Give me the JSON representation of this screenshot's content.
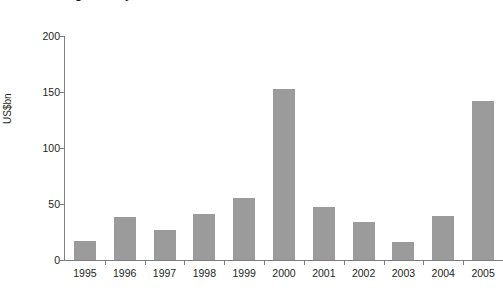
{
  "title": {
    "text": "Banking industry consolidation",
    "note": "clipped-at-top-of-image"
  },
  "axis": {
    "y_title": "US$bn",
    "y_ticks": [
      "0",
      "50",
      "100",
      "150",
      "200"
    ],
    "x_labels": [
      "1995",
      "1996",
      "1997",
      "1998",
      "1999",
      "2000",
      "2001",
      "2002",
      "2003",
      "2004",
      "2005"
    ]
  },
  "colors": {
    "bar": "#9b9b9b",
    "axis": "#7f7f7f",
    "text": "#231f20",
    "background": "#ffffff"
  },
  "chart_data": {
    "type": "bar",
    "title": "Banking industry consolidation",
    "xlabel": "",
    "ylabel": "US$bn",
    "ylim": [
      0,
      200
    ],
    "yticks": [
      0,
      50,
      100,
      150,
      200
    ],
    "grid": false,
    "legend": "none",
    "categories": [
      "1995",
      "1996",
      "1997",
      "1998",
      "1999",
      "2000",
      "2001",
      "2002",
      "2003",
      "2004",
      "2005"
    ],
    "values": [
      17,
      38,
      27,
      41,
      55,
      153,
      47,
      34,
      16,
      39,
      142
    ],
    "units": "US$bn"
  }
}
